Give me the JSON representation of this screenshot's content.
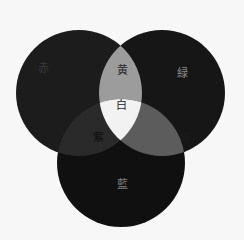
{
  "diagram": {
    "type": "venn-3",
    "sets": [
      {
        "id": "red",
        "label": "赤",
        "fill": "#1c1c1c",
        "text_color": "#3a3a3a"
      },
      {
        "id": "green",
        "label": "緑",
        "fill": "#161616",
        "text_color": "#8a8a8a"
      },
      {
        "id": "blue",
        "label": "藍",
        "fill": "#101010",
        "text_color": "#7a7a7a"
      }
    ],
    "intersections": [
      {
        "id": "red-green",
        "label": "黄",
        "fill": "#9c9c9c",
        "text_color": "#2a2a2a"
      },
      {
        "id": "red-blue",
        "label": "紫",
        "fill": "#2a2a2a",
        "text_color": "#0e0e0e"
      },
      {
        "id": "green-blue",
        "label": "青",
        "fill": "#5c5c5c",
        "text_color": "#1a1a1a"
      },
      {
        "id": "all",
        "label": "白",
        "fill": "#f2f2f2",
        "text_color": "#222222"
      }
    ]
  }
}
